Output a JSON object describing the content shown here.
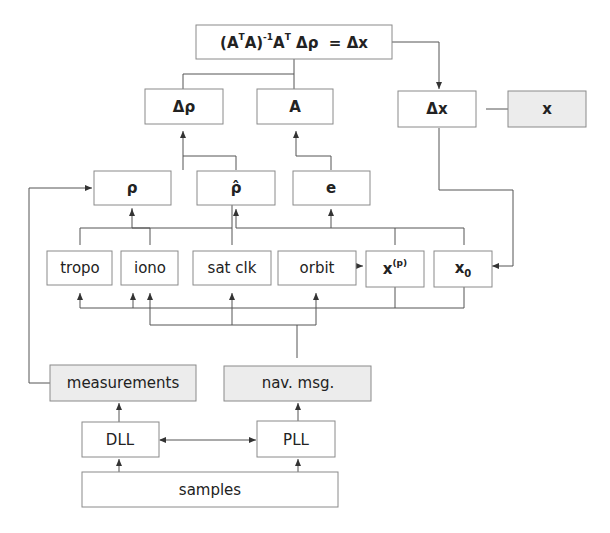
{
  "diagram": {
    "nodes": {
      "equation": {
        "parts": [
          "(A",
          "T",
          "A)",
          "-1",
          "A",
          "T",
          " Δρ  = Δx"
        ]
      },
      "delta_rho": "Δρ",
      "A": "A",
      "delta_x": "Δx",
      "x": "x",
      "rho": "ρ",
      "rho_hat": "ρ̂",
      "e": "e",
      "tropo": "tropo",
      "iono": "iono",
      "sat_clk": "sat clk",
      "orbit": "orbit",
      "x_p": {
        "base": "x",
        "sup": "(p)"
      },
      "x0": {
        "base": "x",
        "sub": "0"
      },
      "measurements": "measurements",
      "nav_msg": "nav. msg.",
      "DLL": "DLL",
      "PLL": "PLL",
      "samples": "samples"
    },
    "colors": {
      "box_fill": "#ffffff",
      "shaded_fill": "#ececec",
      "stroke": "#8a8a8a",
      "line": "#555555",
      "text": "#222222"
    }
  }
}
